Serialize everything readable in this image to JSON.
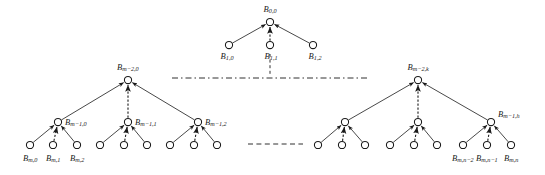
{
  "figure": {
    "kind": "tree-diagram",
    "background_color": "#ffffff",
    "stroke_color": "#1a1a1a",
    "node_fill_color": "#ffffff",
    "node_radius": 3.6,
    "width": 545,
    "height": 175
  },
  "labels": {
    "root": {
      "base": "B",
      "sub": "0,0"
    },
    "level1": [
      {
        "base": "B",
        "sub": "1,0"
      },
      {
        "base": "B",
        "sub": "1,1"
      },
      {
        "base": "B",
        "sub": "1,2"
      }
    ],
    "left_subtree_root": {
      "base": "B",
      "sub": "m−2,0"
    },
    "left_mid": [
      {
        "base": "B",
        "sub": "m−1,0"
      },
      {
        "base": "B",
        "sub": "m−1,1"
      },
      {
        "base": "B",
        "sub": "m−1,2"
      }
    ],
    "left_leaves": [
      {
        "base": "B",
        "sub": "m,0"
      },
      {
        "base": "B",
        "sub": "m,1"
      },
      {
        "base": "B",
        "sub": "m,2"
      }
    ],
    "right_subtree_root": {
      "base": "B",
      "sub": "m−2,k"
    },
    "right_mid": [
      {
        "base": "B",
        "sub": "m−1,h"
      }
    ],
    "right_leaves": [
      {
        "base": "B",
        "sub": "m,n−2"
      },
      {
        "base": "B",
        "sub": "m,n−1"
      },
      {
        "base": "B",
        "sub": "m,n"
      }
    ]
  },
  "nodes": {
    "root": {
      "x": 270,
      "y": 22
    },
    "level1": [
      {
        "x": 229,
        "y": 45
      },
      {
        "x": 270,
        "y": 45
      },
      {
        "x": 313,
        "y": 45
      }
    ],
    "left_root": {
      "x": 128,
      "y": 80
    },
    "left_mid": [
      {
        "x": 58,
        "y": 122
      },
      {
        "x": 128,
        "y": 122
      },
      {
        "x": 198,
        "y": 122
      }
    ],
    "left_leaves": [
      {
        "x": 30,
        "y": 145
      },
      {
        "x": 53,
        "y": 145
      },
      {
        "x": 77,
        "y": 145
      },
      {
        "x": 100,
        "y": 145
      },
      {
        "x": 124,
        "y": 145
      },
      {
        "x": 147,
        "y": 145
      },
      {
        "x": 170,
        "y": 145
      },
      {
        "x": 194,
        "y": 145
      },
      {
        "x": 217,
        "y": 145
      }
    ],
    "right_root": {
      "x": 418,
      "y": 80
    },
    "right_mid": [
      {
        "x": 345,
        "y": 122
      },
      {
        "x": 418,
        "y": 122
      },
      {
        "x": 491,
        "y": 122
      }
    ],
    "right_leaves": [
      {
        "x": 318,
        "y": 145
      },
      {
        "x": 342,
        "y": 145
      },
      {
        "x": 365,
        "y": 145
      },
      {
        "x": 390,
        "y": 145
      },
      {
        "x": 414,
        "y": 145
      },
      {
        "x": 437,
        "y": 145
      },
      {
        "x": 463,
        "y": 145
      },
      {
        "x": 487,
        "y": 145
      },
      {
        "x": 511,
        "y": 145
      }
    ]
  },
  "separators": {
    "upper_dashdot": {
      "x1": 172,
      "x2": 370,
      "y": 78
    },
    "upper_vertical": {
      "x": 270,
      "y1": 54,
      "y2": 76
    },
    "lower_dashed": {
      "x1": 248,
      "x2": 303,
      "y": 144
    }
  }
}
